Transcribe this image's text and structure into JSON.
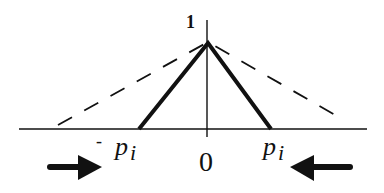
{
  "diagram": {
    "type": "triangular-function-shrinking",
    "labels": {
      "peak_value": "1",
      "origin": "0",
      "neg_label_sign": "-",
      "neg_label_var": "p",
      "neg_label_sub": "i",
      "pos_label_var": "p",
      "pos_label_sub": "i"
    },
    "shapes": {
      "solid_triangle": {
        "left_x": -1,
        "right_x": 1,
        "peak": 1,
        "style": "solid-thick"
      },
      "dashed_triangle": {
        "style": "dashed",
        "wider": true
      }
    },
    "arrows": [
      {
        "name": "right-arrow",
        "direction": "right",
        "position": "left-bottom"
      },
      {
        "name": "left-arrow",
        "direction": "left",
        "position": "right-bottom"
      }
    ],
    "colors": {
      "stroke": "#111111",
      "background": "#ffffff"
    }
  }
}
